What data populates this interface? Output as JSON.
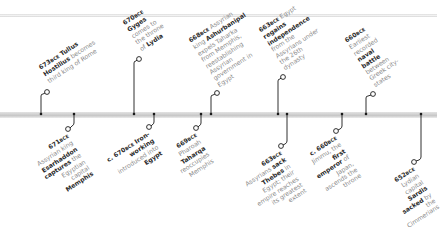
{
  "timeline": {
    "colors": {
      "bar": "#c9c9c9",
      "stem": "#1a1a1a",
      "text_light": "#8a8a8a",
      "text_bold": "#2b2b2b"
    },
    "events": [
      {
        "id": "e673",
        "year": "673",
        "era": "BCE",
        "side": "up",
        "parts": [
          {
            "t": " Tullus Hostilius",
            "b": true
          },
          {
            "t": " becomes third king of Rome",
            "b": false
          }
        ]
      },
      {
        "id": "e671",
        "year": "671",
        "era": "BCE",
        "side": "down",
        "parts": [
          {
            "t": " Assyrian king ",
            "b": false
          },
          {
            "t": "Esarhaddon captures",
            "b": true
          },
          {
            "t": " the Egyptian capital ",
            "b": false
          },
          {
            "t": "Memphis",
            "b": true
          }
        ]
      },
      {
        "id": "e670g",
        "year": "670",
        "era": "BCE",
        "side": "up",
        "parts": [
          {
            "t": " Gyges",
            "b": true
          },
          {
            "t": " comes to the throne of ",
            "b": false
          },
          {
            "t": "Lydia",
            "b": true
          }
        ]
      },
      {
        "id": "e670i",
        "year": "c. 670",
        "era": "BCE",
        "side": "down",
        "parts": [
          {
            "t": " Iron-working",
            "b": true
          },
          {
            "t": " introduced into ",
            "b": false
          },
          {
            "t": "Egypt",
            "b": true
          }
        ]
      },
      {
        "id": "e669",
        "year": "669",
        "era": "BCE",
        "side": "down",
        "parts": [
          {
            "t": " Pharoah ",
            "b": false
          },
          {
            "t": "Taharqa",
            "b": true
          },
          {
            "t": " reoccupies Memphis",
            "b": false
          }
        ]
      },
      {
        "id": "e668",
        "year": "668",
        "era": "BCE",
        "side": "up",
        "parts": [
          {
            "t": " Assyrian king ",
            "b": false
          },
          {
            "t": "Ashurbanipal",
            "b": true
          },
          {
            "t": " expels Taharka from Memphis, reestablishing Assyrian government in Egypt",
            "b": false
          }
        ]
      },
      {
        "id": "e663e",
        "year": "663",
        "era": "BCE",
        "side": "up",
        "parts": [
          {
            "t": " Egypt ",
            "b": false
          },
          {
            "t": "regains independence",
            "b": true
          },
          {
            "t": " from the Assyrians under the 26th dynasty",
            "b": false
          }
        ]
      },
      {
        "id": "e663t",
        "year": "663",
        "era": "BCE",
        "side": "down",
        "parts": [
          {
            "t": " Assyrians ",
            "b": false
          },
          {
            "t": "sack Thebes",
            "b": true
          },
          {
            "t": " in Egypt; their empire reaches its greatest extent",
            "b": false
          }
        ]
      },
      {
        "id": "e660j",
        "year": "c. 660",
        "era": "BCE",
        "side": "down",
        "parts": [
          {
            "t": " Jimmu, the ",
            "b": false
          },
          {
            "t": "first emperor",
            "b": true
          },
          {
            "t": " of Japan, ascends the throne",
            "b": false
          }
        ]
      },
      {
        "id": "e660n",
        "year": "660",
        "era": "BCE",
        "side": "up",
        "parts": [
          {
            "t": " Earliest recorded ",
            "b": false
          },
          {
            "t": "naval battle",
            "b": true
          },
          {
            "t": " between Greek city-states",
            "b": false
          }
        ]
      },
      {
        "id": "e652",
        "year": "652",
        "era": "BCE",
        "side": "down",
        "parts": [
          {
            "t": " Lydian capital ",
            "b": false
          },
          {
            "t": "Sardis sacked",
            "b": true
          },
          {
            "t": " by the Cimmerians",
            "b": false
          }
        ]
      }
    ]
  }
}
